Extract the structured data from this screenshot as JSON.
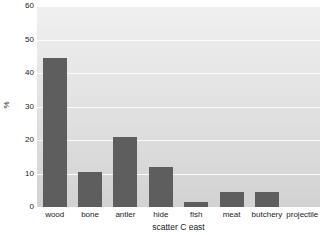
{
  "chart_data": {
    "type": "bar",
    "title": "",
    "xlabel": "scatter C east",
    "ylabel": "%",
    "categories": [
      "wood",
      "bone",
      "antler",
      "hide",
      "fish",
      "meat",
      "butchery",
      "projectile"
    ],
    "values": [
      44.5,
      10.5,
      21.0,
      12.0,
      1.5,
      4.5,
      4.5,
      0.0
    ],
    "ylim": [
      0,
      60
    ],
    "yticks": [
      0,
      10,
      20,
      30,
      40,
      50,
      60
    ],
    "ytick_labels": [
      "0",
      "10",
      "20",
      "30",
      "40",
      "50",
      "60"
    ],
    "grid": true,
    "grid_axis": "y",
    "legend": false,
    "legend_position": "none",
    "bar_color": "#5e5e5e",
    "plot_bg_top": "#f0f0f0",
    "plot_bg_bottom": "#d2d2d2",
    "gridline_color": "#fbfbfb",
    "figure_bg": "#ffffff",
    "text_color": "#1a1a1a"
  }
}
